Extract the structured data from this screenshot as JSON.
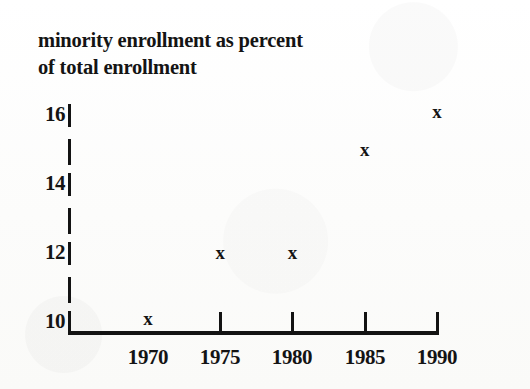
{
  "figure": {
    "title_line_1": "minority enrollment as percent",
    "title_line_2": "of total enrollment",
    "marker_glyph": "x",
    "ink_color": "#131313",
    "background_color": "#fdfdfd"
  },
  "chart_data": {
    "type": "scatter",
    "title": "minority enrollment as percent of total enrollment",
    "xlabel": "",
    "ylabel": "",
    "x": [
      1970,
      1975,
      1980,
      1985,
      1990
    ],
    "values": [
      10.1,
      12.0,
      12.0,
      15.0,
      16.1
    ],
    "series": [
      {
        "name": "minority enrollment as percent of total enrollment",
        "marker": "x",
        "points": [
          {
            "x": 1970,
            "y": 10.1
          },
          {
            "x": 1975,
            "y": 12.0
          },
          {
            "x": 1980,
            "y": 12.0
          },
          {
            "x": 1985,
            "y": 15.0
          },
          {
            "x": 1990,
            "y": 16.1
          }
        ]
      }
    ],
    "xlim": [
      1967,
      1990
    ],
    "ylim": [
      10,
      16.6
    ],
    "xticks": [
      1970,
      1975,
      1980,
      1985,
      1990
    ],
    "xtick_labels": [
      "1970",
      "1975",
      "1980",
      "1985",
      "1990"
    ],
    "yticks": [
      10,
      12,
      14,
      16
    ],
    "ytick_labels": [
      "10",
      "12",
      "14",
      "16"
    ],
    "grid": false,
    "legend": "none"
  },
  "axes": {
    "y_labels": [
      "16",
      "14",
      "12",
      "10"
    ],
    "x_labels": [
      "1970",
      "1975",
      "1980",
      "1985",
      "1990"
    ]
  }
}
